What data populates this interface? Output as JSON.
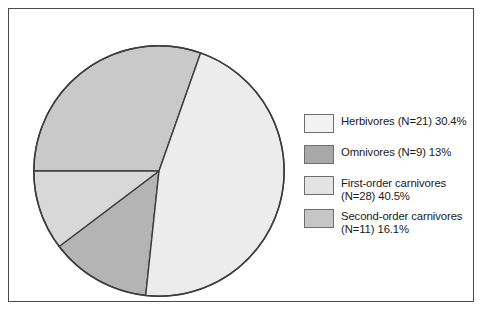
{
  "chart_data": {
    "type": "pie",
    "title": "",
    "subtitle": "",
    "xlabel": "",
    "ylabel": "",
    "grid": false,
    "legend_position": "right",
    "total_n": 69,
    "categories": [
      "Herbivores (N=21) 30.4%",
      "Omnivores (N=9) 13%",
      "First-order carnivores (N=28) 40.5%",
      "Second-order carnivores (N=11) 16.1%"
    ],
    "values": [
      30.4,
      13,
      40.5,
      16.1
    ],
    "counts": [
      21,
      9,
      28,
      11
    ],
    "slices": [
      {
        "name": "Herbivores",
        "label": "Herbivores (N=21) 30.4%",
        "count_text": "N=21",
        "percent_text": "30.4%",
        "value": 30.4,
        "count": 21,
        "color": "#c9c9c9",
        "swatch_color": "#f2f2f2",
        "start_angle": 180,
        "end_angle": 289.4
      },
      {
        "name": "Omnivores",
        "label": "Omnivores (N=9) 13%",
        "count_text": "N=9",
        "percent_text": "13%",
        "value": 13,
        "count": 9,
        "color": "#b4b4b4",
        "swatch_color": "#a8a8a8",
        "start_angle": 96.1,
        "end_angle": 142.9
      },
      {
        "name": "First-order carnivores",
        "label": "First-order carnivores\n(N=28) 40.5%",
        "count_text": "N=28",
        "percent_text": "40.5%",
        "value": 40.5,
        "count": 28,
        "color": "#ececec",
        "swatch_color": "#e3e3e3",
        "start_angle": 289.4,
        "end_angle": 96.1
      },
      {
        "name": "Second-order carnivores",
        "label": "Second-order carnivores\n(N=11) 16.1%",
        "count_text": "N=11",
        "percent_text": "16.1%",
        "value": 16.1,
        "count": 11,
        "color": "#d8d8d8",
        "swatch_color": "#c6c6c6",
        "start_angle": 142.9,
        "end_angle": 180
      }
    ]
  },
  "legend": {
    "items": [
      {
        "label": "Herbivores (N=21) 30.4%",
        "swatch_color": "#f2f2f2"
      },
      {
        "label": "Omnivores (N=9) 13%",
        "swatch_color": "#a8a8a8"
      },
      {
        "label": "First-order carnivores\n(N=28) 40.5%",
        "swatch_color": "#e3e3e3"
      },
      {
        "label": "Second-order carnivores\n(N=11) 16.1%",
        "swatch_color": "#c6c6c6"
      }
    ]
  },
  "style": {
    "frame_color": "#4a4a4a",
    "slice_outline_color": "#3c3c3c",
    "background": "#ffffff",
    "text_color": "#1a1a1a"
  }
}
